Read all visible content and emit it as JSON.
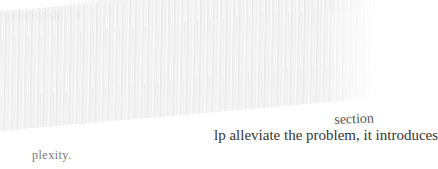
{
  "document": {
    "type": "book-page-excerpt",
    "visible_fragments": {
      "top_left": "relationshi   T",
      "right_upper": "section",
      "right_lower": "lp alleviate the problem, it introduces",
      "bottom_left": "plexity."
    }
  },
  "colors": {
    "background": "#ffffff",
    "text": "#333333",
    "occlusion_band": "#eeeeee"
  }
}
